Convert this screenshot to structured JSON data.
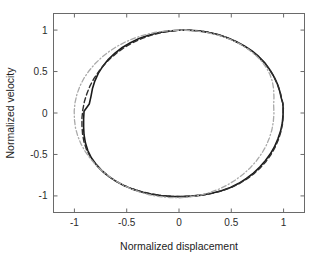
{
  "figure": {
    "background_color": "#ffffff",
    "axes_color": "#6a6a6a",
    "width": 321,
    "height": 258
  },
  "chart_data": {
    "type": "line",
    "title": "",
    "subtitle": "",
    "xlabel": "Normalized displacement",
    "ylabel": "Normalized velocity",
    "xlim": [
      -1.2,
      1.2
    ],
    "ylim": [
      -1.2,
      1.2
    ],
    "xticks": [
      -1,
      -0.5,
      0,
      0.5,
      1
    ],
    "xticklabels": [
      "-1",
      "-0.5",
      "0",
      "0.5",
      "1"
    ],
    "yticks": [
      1,
      0.5,
      0,
      -0.5,
      -1
    ],
    "yticklabels": [
      "1",
      "0.5",
      "0",
      "-0.5",
      "-1"
    ],
    "grid": false,
    "legend": null,
    "legend_position": "none",
    "box": true,
    "annotations": [],
    "series": [
      {
        "name": "solid-black-orbit",
        "style": "solid",
        "color": "#1a1a1a",
        "width": 1.6,
        "closed": true,
        "points": [
          [
            0.995,
            0.075
          ],
          [
            0.995,
            -0.02
          ],
          [
            0.988,
            -0.12
          ],
          [
            0.972,
            -0.215
          ],
          [
            0.945,
            -0.315
          ],
          [
            0.912,
            -0.41
          ],
          [
            0.872,
            -0.495
          ],
          [
            0.825,
            -0.575
          ],
          [
            0.772,
            -0.652
          ],
          [
            0.712,
            -0.725
          ],
          [
            0.645,
            -0.79
          ],
          [
            0.572,
            -0.848
          ],
          [
            0.492,
            -0.898
          ],
          [
            0.405,
            -0.938
          ],
          [
            0.312,
            -0.968
          ],
          [
            0.215,
            -0.99
          ],
          [
            0.118,
            -1.002
          ],
          [
            0.022,
            -1.008
          ],
          [
            -0.075,
            -1.005
          ],
          [
            -0.172,
            -0.995
          ],
          [
            -0.268,
            -0.978
          ],
          [
            -0.358,
            -0.952
          ],
          [
            -0.445,
            -0.918
          ],
          [
            -0.528,
            -0.875
          ],
          [
            -0.605,
            -0.822
          ],
          [
            -0.675,
            -0.762
          ],
          [
            -0.738,
            -0.695
          ],
          [
            -0.792,
            -0.62
          ],
          [
            -0.838,
            -0.54
          ],
          [
            -0.872,
            -0.452
          ],
          [
            -0.895,
            -0.36
          ],
          [
            -0.908,
            -0.265
          ],
          [
            -0.912,
            -0.168
          ],
          [
            -0.912,
            -0.072
          ],
          [
            -0.908,
            0.022
          ],
          [
            -0.858,
            0.108
          ],
          [
            -0.842,
            0.198
          ],
          [
            -0.828,
            0.292
          ],
          [
            -0.805,
            0.385
          ],
          [
            -0.772,
            0.478
          ],
          [
            -0.728,
            0.565
          ],
          [
            -0.675,
            0.648
          ],
          [
            -0.612,
            0.722
          ],
          [
            -0.542,
            0.79
          ],
          [
            -0.465,
            0.848
          ],
          [
            -0.382,
            0.898
          ],
          [
            -0.292,
            0.938
          ],
          [
            -0.198,
            0.968
          ],
          [
            -0.102,
            0.988
          ],
          [
            -0.005,
            0.998
          ],
          [
            0.092,
            0.998
          ],
          [
            0.188,
            0.99
          ],
          [
            0.282,
            0.972
          ],
          [
            0.375,
            0.945
          ],
          [
            0.462,
            0.908
          ],
          [
            0.545,
            0.862
          ],
          [
            0.625,
            0.808
          ],
          [
            0.698,
            0.748
          ],
          [
            0.762,
            0.682
          ],
          [
            0.818,
            0.608
          ],
          [
            0.865,
            0.528
          ],
          [
            0.905,
            0.445
          ],
          [
            0.938,
            0.358
          ],
          [
            0.962,
            0.268
          ],
          [
            0.98,
            0.172
          ],
          [
            0.992,
            0.122
          ]
        ]
      },
      {
        "name": "dashed-dark-orbit",
        "style": "dashed",
        "color": "#2e2e2e",
        "width": 1.4,
        "closed": true,
        "points": [
          [
            0.998,
            0.062
          ],
          [
            0.996,
            -0.035
          ],
          [
            0.99,
            -0.132
          ],
          [
            0.974,
            -0.228
          ],
          [
            0.95,
            -0.322
          ],
          [
            0.918,
            -0.415
          ],
          [
            0.878,
            -0.505
          ],
          [
            0.83,
            -0.588
          ],
          [
            0.775,
            -0.665
          ],
          [
            0.714,
            -0.735
          ],
          [
            0.646,
            -0.798
          ],
          [
            0.572,
            -0.855
          ],
          [
            0.492,
            -0.902
          ],
          [
            0.406,
            -0.94
          ],
          [
            0.315,
            -0.97
          ],
          [
            0.219,
            -0.99
          ],
          [
            0.121,
            -1.003
          ],
          [
            0.024,
            -1.008
          ],
          [
            -0.074,
            -1.005
          ],
          [
            -0.171,
            -0.994
          ],
          [
            -0.266,
            -0.975
          ],
          [
            -0.358,
            -0.948
          ],
          [
            -0.447,
            -0.914
          ],
          [
            -0.532,
            -0.87
          ],
          [
            -0.61,
            -0.818
          ],
          [
            -0.682,
            -0.757
          ],
          [
            -0.746,
            -0.688
          ],
          [
            -0.802,
            -0.612
          ],
          [
            -0.848,
            -0.53
          ],
          [
            -0.884,
            -0.443
          ],
          [
            -0.908,
            -0.352
          ],
          [
            -0.922,
            -0.256
          ],
          [
            -0.928,
            -0.158
          ],
          [
            -0.928,
            -0.06
          ],
          [
            -0.92,
            0.038
          ],
          [
            -0.905,
            0.135
          ],
          [
            -0.882,
            0.23
          ],
          [
            -0.852,
            0.324
          ],
          [
            -0.814,
            0.414
          ],
          [
            -0.768,
            0.5
          ],
          [
            -0.715,
            0.582
          ],
          [
            -0.655,
            0.66
          ],
          [
            -0.588,
            0.732
          ],
          [
            -0.515,
            0.796
          ],
          [
            -0.436,
            0.852
          ],
          [
            -0.352,
            0.9
          ],
          [
            -0.264,
            0.94
          ],
          [
            -0.172,
            0.968
          ],
          [
            -0.078,
            0.988
          ],
          [
            0.018,
            0.998
          ],
          [
            0.114,
            0.998
          ],
          [
            0.21,
            0.988
          ],
          [
            0.303,
            0.968
          ],
          [
            0.394,
            0.938
          ],
          [
            0.48,
            0.898
          ],
          [
            0.562,
            0.85
          ],
          [
            0.639,
            0.794
          ],
          [
            0.71,
            0.73
          ],
          [
            0.774,
            0.66
          ],
          [
            0.83,
            0.584
          ],
          [
            0.877,
            0.504
          ],
          [
            0.916,
            0.419
          ],
          [
            0.947,
            0.331
          ],
          [
            0.97,
            0.24
          ],
          [
            0.986,
            0.148
          ],
          [
            0.995,
            0.105
          ]
        ]
      },
      {
        "name": "gray-dashdot-orbit",
        "style": "dashdot",
        "color": "#a9a9a9",
        "width": 1.3,
        "closed": true,
        "points": [
          [
            0.905,
            0.092
          ],
          [
            0.908,
            -0.005
          ],
          [
            0.902,
            -0.105
          ],
          [
            0.888,
            -0.205
          ],
          [
            0.864,
            -0.302
          ],
          [
            0.832,
            -0.398
          ],
          [
            0.79,
            -0.49
          ],
          [
            0.74,
            -0.578
          ],
          [
            0.682,
            -0.66
          ],
          [
            0.616,
            -0.736
          ],
          [
            0.544,
            -0.805
          ],
          [
            0.466,
            -0.866
          ],
          [
            0.382,
            -0.918
          ],
          [
            0.293,
            -0.96
          ],
          [
            0.2,
            -0.992
          ],
          [
            0.105,
            -1.012
          ],
          [
            0.008,
            -1.022
          ],
          [
            -0.09,
            -1.02
          ],
          [
            -0.188,
            -1.008
          ],
          [
            -0.285,
            -0.986
          ],
          [
            -0.379,
            -0.952
          ],
          [
            -0.47,
            -0.908
          ],
          [
            -0.556,
            -0.855
          ],
          [
            -0.638,
            -0.792
          ],
          [
            -0.713,
            -0.722
          ],
          [
            -0.782,
            -0.644
          ],
          [
            -0.842,
            -0.56
          ],
          [
            -0.894,
            -0.47
          ],
          [
            -0.936,
            -0.376
          ],
          [
            -0.968,
            -0.278
          ],
          [
            -0.99,
            -0.178
          ],
          [
            -1.0,
            -0.077
          ],
          [
            -1.002,
            0.025
          ],
          [
            -0.994,
            0.126
          ],
          [
            -0.976,
            0.226
          ],
          [
            -0.948,
            0.323
          ],
          [
            -0.91,
            0.417
          ],
          [
            -0.862,
            0.506
          ],
          [
            -0.806,
            0.59
          ],
          [
            -0.742,
            0.668
          ],
          [
            -0.67,
            0.74
          ],
          [
            -0.592,
            0.804
          ],
          [
            -0.508,
            0.86
          ],
          [
            -0.419,
            0.906
          ],
          [
            -0.327,
            0.943
          ],
          [
            -0.232,
            0.971
          ],
          [
            -0.135,
            0.989
          ],
          [
            -0.038,
            0.998
          ],
          [
            0.06,
            0.998
          ],
          [
            0.157,
            0.99
          ],
          [
            0.252,
            0.974
          ],
          [
            0.345,
            0.949
          ],
          [
            0.434,
            0.915
          ],
          [
            0.518,
            0.873
          ],
          [
            0.596,
            0.822
          ],
          [
            0.668,
            0.764
          ],
          [
            0.732,
            0.698
          ],
          [
            0.788,
            0.626
          ],
          [
            0.834,
            0.548
          ],
          [
            0.87,
            0.465
          ],
          [
            0.893,
            0.378
          ],
          [
            0.905,
            0.288
          ],
          [
            0.908,
            0.19
          ]
        ]
      }
    ]
  },
  "axis": {
    "x_title": "Normalized displacement",
    "y_title": "Normalized velocity",
    "x_tick_labels": [
      "-1",
      "-0.5",
      "0",
      "0.5",
      "1"
    ],
    "y_tick_labels": [
      "1",
      "0.5",
      "0",
      "-0.5",
      "-1"
    ]
  }
}
